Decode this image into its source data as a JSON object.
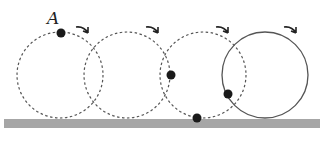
{
  "diagram": {
    "point_label": "A",
    "colors": {
      "ground": "#a6a6a6",
      "circle": "#555555",
      "dot": "#1a1a1a",
      "background": "#ffffff"
    },
    "ground": {
      "x": 4,
      "y": 119,
      "width": 316,
      "height": 9
    },
    "circles": [
      {
        "cx": 60,
        "cy": 75,
        "r": 43,
        "style": "dashed",
        "dot": {
          "x": 61,
          "y": 33
        },
        "arrow": {
          "x": 82,
          "y": 30
        }
      },
      {
        "cx": 127,
        "cy": 75,
        "r": 43,
        "style": "dashed",
        "dot": null,
        "arrow": {
          "x": 152,
          "y": 30
        }
      },
      {
        "cx": 203,
        "cy": 75,
        "r": 43,
        "style": "dashed",
        "dot": {
          "x": 171,
          "y": 75
        },
        "arrow": {
          "x": 222,
          "y": 30
        }
      },
      {
        "cx": 265,
        "cy": 75,
        "r": 43,
        "style": "solid",
        "dot": {
          "x": 228,
          "y": 94
        },
        "arrow": {
          "x": 290,
          "y": 30
        }
      }
    ],
    "extra_dots": [
      {
        "x": 197,
        "y": 118
      }
    ]
  }
}
